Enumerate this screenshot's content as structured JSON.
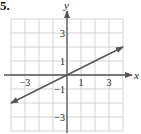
{
  "problem": {
    "number": "5."
  },
  "chart_data": {
    "type": "line",
    "title": "",
    "xlabel": "x",
    "ylabel": "y",
    "xlim": [
      -4,
      4
    ],
    "ylim": [
      -4,
      4
    ],
    "grid": true,
    "grid_step": 1,
    "x_ticks": [
      -3,
      1,
      3
    ],
    "x_tick_labels": [
      "−3",
      "1",
      "3"
    ],
    "y_ticks": [
      3,
      1,
      -1,
      -3
    ],
    "y_tick_labels": [
      "3",
      "1",
      "−1",
      "−3"
    ],
    "series": [
      {
        "name": "y = x/2",
        "equation": "y = 0.5x",
        "slope": 0.5,
        "intercept": 0,
        "x": [
          -4,
          4
        ],
        "y": [
          -2,
          2
        ],
        "arrows": "both"
      }
    ],
    "legend": "none"
  },
  "colors": {
    "grid": "#c8c8c8",
    "axis": "#555555",
    "line": "#555555",
    "text": "#222222"
  }
}
